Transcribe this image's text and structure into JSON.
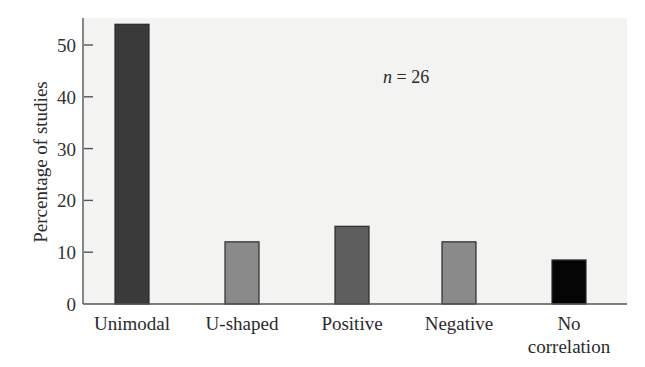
{
  "chart_data": {
    "type": "bar",
    "title": "",
    "xlabel": "",
    "ylabel": "Percentage of studies",
    "ylim": [
      0,
      55
    ],
    "yticks": [
      0,
      10,
      20,
      30,
      40,
      50
    ],
    "grid": false,
    "legend": null,
    "categories": [
      "Unimodal",
      "U-shaped",
      "Positive",
      "Negative",
      "No correlation"
    ],
    "category_lines": [
      [
        "Unimodal"
      ],
      [
        "U-shaped"
      ],
      [
        "Positive"
      ],
      [
        "Negative"
      ],
      [
        "No",
        "correlation"
      ]
    ],
    "values": [
      54,
      12,
      15,
      12,
      8.5
    ],
    "bar_colors": [
      "#3a3a3a",
      "#8a8a8a",
      "#5e5e5e",
      "#8a8a8a",
      "#050505"
    ],
    "annotations": [
      {
        "text_italic": "n",
        "text_rest": " = 26"
      }
    ]
  },
  "colors": {
    "plot_background": "#f3f3f2",
    "axis": "#555555"
  }
}
